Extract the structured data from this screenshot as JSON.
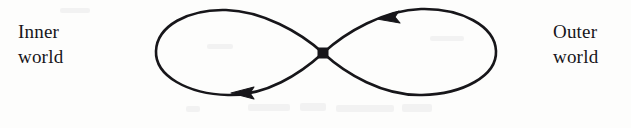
{
  "page": {
    "background_color": "#fdfdfc",
    "ink_color": "#17161a",
    "width": 631,
    "height": 128
  },
  "labels": {
    "left": {
      "name": "inner-world-label",
      "line1": "Inner",
      "line2": "world"
    },
    "right": {
      "name": "outer-world-label",
      "line1": "Outer",
      "line2": "world"
    }
  },
  "diagram": {
    "type": "lemniscate",
    "stroke_color": "#17161a",
    "stroke_width": 2.6,
    "node": {
      "name": "crossing-node",
      "x": 323,
      "y": 53,
      "size": 11,
      "shape": "diamond"
    },
    "lobes": [
      {
        "name": "left-lobe",
        "side": "left",
        "x_min": 155,
        "x_max": 323,
        "y_min": 10,
        "y_max": 95,
        "direction": "clockwise"
      },
      {
        "name": "right-lobe",
        "side": "right",
        "x_min": 323,
        "x_max": 497,
        "y_min": 8,
        "y_max": 95,
        "direction": "counterclockwise"
      }
    ],
    "arrowheads": [
      {
        "name": "upper-right-arrowhead",
        "x": 390,
        "y": 16,
        "angle_deg": 196,
        "length": 21,
        "width": 13,
        "points": "left"
      },
      {
        "name": "lower-left-arrowhead",
        "x": 245,
        "y": 93,
        "angle_deg": 186,
        "length": 21,
        "width": 13,
        "points": "left"
      }
    ]
  }
}
